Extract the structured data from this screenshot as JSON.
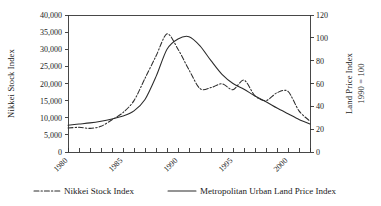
{
  "chart_data": {
    "type": "line",
    "title": "",
    "xlabel": "",
    "ylabel": "Nikkei Stock Index",
    "y2label": "Land Price Index\n1990 = 100",
    "y2label_line1": "Land Price Index",
    "y2label_line2": "1990 = 100",
    "grid": false,
    "legend_position": "bottom",
    "xlim": [
      1980,
      2002
    ],
    "ylim": [
      0,
      40000
    ],
    "y2lim": [
      0,
      120
    ],
    "xticks": [
      1980,
      1981,
      1982,
      1983,
      1984,
      1985,
      1986,
      1987,
      1988,
      1989,
      1990,
      1991,
      1992,
      1993,
      1994,
      1995,
      1996,
      1997,
      1998,
      1999,
      2000,
      2001,
      2002
    ],
    "xtick_labels_shown": [
      "1980",
      "1985",
      "1990",
      "1995",
      "2000"
    ],
    "xtick_labels_shown_values": [
      1980,
      1985,
      1990,
      1995,
      2000
    ],
    "ytick_labels": [
      "0",
      "5,000",
      "10,000",
      "15,000",
      "20,000",
      "25,000",
      "30,000",
      "35,000",
      "40,000"
    ],
    "ytick_values": [
      0,
      5000,
      10000,
      15000,
      20000,
      25000,
      30000,
      35000,
      40000
    ],
    "y2tick_labels": [
      "0",
      "20",
      "40",
      "60",
      "80",
      "100",
      "120"
    ],
    "y2tick_values": [
      0,
      20,
      40,
      60,
      80,
      100,
      120
    ],
    "x": [
      1980,
      1981,
      1982,
      1983,
      1984,
      1985,
      1986,
      1987,
      1988,
      1989,
      1990,
      1991,
      1992,
      1993,
      1994,
      1995,
      1996,
      1997,
      1998,
      1999,
      2000,
      2001,
      2002
    ],
    "series": [
      {
        "name": "Nikkei Stock Index",
        "axis": "left",
        "style": "dashed",
        "color": "#2b2b2b",
        "values": [
          7000,
          7200,
          6900,
          7500,
          9400,
          11500,
          15000,
          21500,
          28000,
          34500,
          30000,
          24000,
          18500,
          18800,
          19900,
          18200,
          21000,
          16400,
          15000,
          17300,
          17700,
          12000,
          9000
        ]
      },
      {
        "name": "Metropolitan Urban Land Price Index",
        "axis": "right",
        "style": "solid",
        "color": "#2b2b2b",
        "values": [
          23.5,
          24.5,
          25.5,
          27.0,
          29.0,
          31.5,
          36.0,
          46.0,
          66.0,
          90.0,
          99.0,
          101.0,
          93.0,
          80.0,
          68.0,
          60.0,
          55.0,
          49.0,
          44.0,
          38.5,
          33.5,
          28.5,
          24.5
        ]
      }
    ],
    "annotations": []
  },
  "legend": {
    "items": [
      {
        "label": "Nikkei Stock Index",
        "style": "dashed"
      },
      {
        "label": "Metropolitan Urban Land Price Index",
        "style": "solid"
      }
    ]
  },
  "axes": {
    "left_title": "Nikkei Stock Index",
    "right_title_line1": "Land Price Index",
    "right_title_line2": "1990 = 100"
  }
}
